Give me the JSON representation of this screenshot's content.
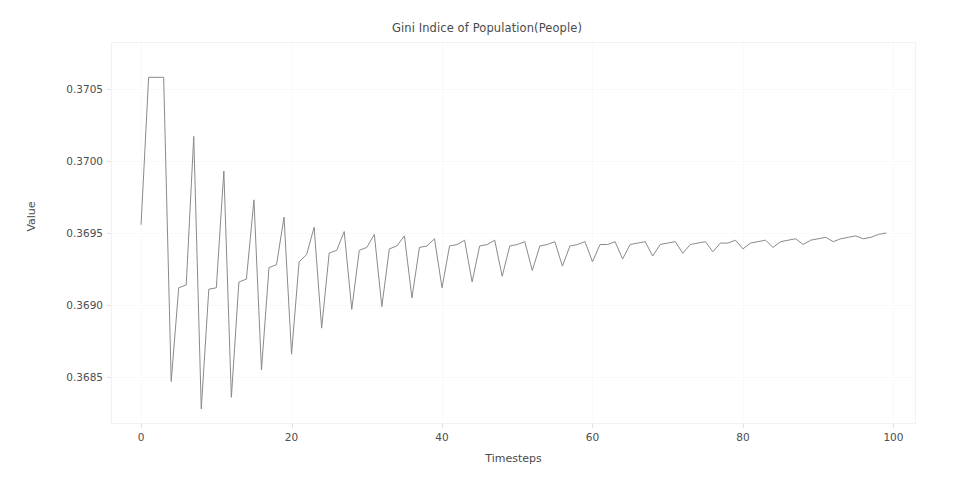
{
  "chart_data": {
    "type": "line",
    "title": "Gini Indice of Population(People)",
    "xlabel": "Timesteps",
    "ylabel": "Value",
    "xlim": [
      -4,
      103
    ],
    "ylim": [
      0.368175,
      0.370825
    ],
    "grid": true,
    "legend": false,
    "line_color": "#8a8a8a",
    "xticks": [
      0,
      20,
      40,
      60,
      80,
      100
    ],
    "xtick_labels": [
      "0",
      "20",
      "40",
      "60",
      "80",
      "100"
    ],
    "yticks": [
      0.3685,
      0.369,
      0.3695,
      0.37,
      0.3705
    ],
    "ytick_labels": [
      "0.3685",
      "0.3690",
      "0.3695",
      "0.3700",
      "0.3705"
    ],
    "series": [
      {
        "name": "Gini Index",
        "x": [
          0,
          1,
          2,
          3,
          4,
          5,
          6,
          7,
          8,
          9,
          10,
          11,
          12,
          13,
          14,
          15,
          16,
          17,
          18,
          19,
          20,
          21,
          22,
          23,
          24,
          25,
          26,
          27,
          28,
          29,
          30,
          31,
          32,
          33,
          34,
          35,
          36,
          37,
          38,
          39,
          40,
          41,
          42,
          43,
          44,
          45,
          46,
          47,
          48,
          49,
          50,
          51,
          52,
          53,
          54,
          55,
          56,
          57,
          58,
          59,
          60,
          61,
          62,
          63,
          64,
          65,
          66,
          67,
          68,
          69,
          70,
          71,
          72,
          73,
          74,
          75,
          76,
          77,
          78,
          79,
          80,
          81,
          82,
          83,
          84,
          85,
          86,
          87,
          88,
          89,
          90,
          91,
          92,
          93,
          94,
          95,
          96,
          97,
          98,
          99
        ],
        "y": [
          0.36956,
          0.37058,
          0.37058,
          0.37058,
          0.36847,
          0.36912,
          0.36914,
          0.37017,
          0.36828,
          0.36911,
          0.36912,
          0.36993,
          0.36836,
          0.36916,
          0.36918,
          0.36973,
          0.36855,
          0.36926,
          0.36928,
          0.36961,
          0.36866,
          0.3693,
          0.36935,
          0.36954,
          0.36884,
          0.36936,
          0.36938,
          0.36951,
          0.36897,
          0.36938,
          0.3694,
          0.36949,
          0.36899,
          0.36939,
          0.36941,
          0.36948,
          0.36905,
          0.3694,
          0.36941,
          0.36946,
          0.36912,
          0.36941,
          0.36942,
          0.36945,
          0.36916,
          0.36941,
          0.36942,
          0.36945,
          0.3692,
          0.36941,
          0.36942,
          0.36944,
          0.36924,
          0.36941,
          0.36942,
          0.36944,
          0.36927,
          0.36941,
          0.36942,
          0.36944,
          0.3693,
          0.36942,
          0.36942,
          0.36944,
          0.36932,
          0.36942,
          0.36943,
          0.36944,
          0.36934,
          0.36942,
          0.36943,
          0.36944,
          0.36936,
          0.36942,
          0.36943,
          0.36944,
          0.36937,
          0.36943,
          0.36943,
          0.36945,
          0.36939,
          0.36943,
          0.36944,
          0.36945,
          0.3694,
          0.36944,
          0.36945,
          0.36946,
          0.36942,
          0.36945,
          0.36946,
          0.36947,
          0.36944,
          0.36946,
          0.36947,
          0.36948,
          0.36946,
          0.36947,
          0.36949,
          0.3695
        ]
      }
    ]
  }
}
